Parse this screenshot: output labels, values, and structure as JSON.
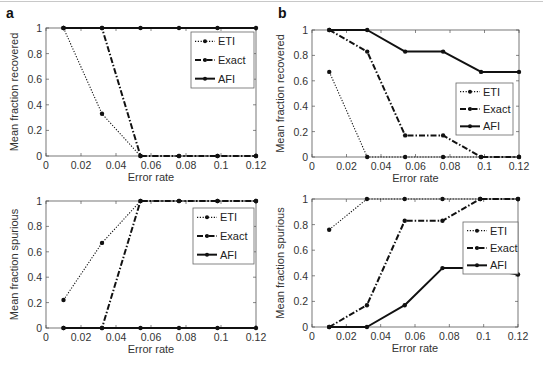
{
  "figure": {
    "panel_labels": [
      "a",
      "b"
    ],
    "series_names": [
      "ETI",
      "Exact",
      "AFI"
    ],
    "xlabel": "Error rate",
    "x_ticks": [
      "0",
      "0.02",
      "0.04",
      "0.06",
      "0.08",
      "0.1",
      "0.12"
    ],
    "y_ticks": [
      "0",
      "0.2",
      "0.4",
      "0.6",
      "0.8",
      "1"
    ]
  },
  "chart_data": [
    {
      "id": "a-recovered",
      "panel": "a",
      "type": "line",
      "title": "",
      "xlabel": "Error rate",
      "ylabel": "Mean fraction recovered",
      "xlim": [
        0,
        0.12
      ],
      "ylim": [
        0,
        1
      ],
      "grid": false,
      "legend_position": "upper right",
      "x": [
        0.01,
        0.032,
        0.054,
        0.076,
        0.098,
        0.12
      ],
      "series": [
        {
          "name": "ETI",
          "style": "dotted",
          "values": [
            1,
            0.33,
            0,
            0,
            0,
            0
          ]
        },
        {
          "name": "Exact",
          "style": "dashdot",
          "values": [
            1,
            1,
            0,
            0,
            0,
            0
          ]
        },
        {
          "name": "AFI",
          "style": "solid",
          "values": [
            1,
            1,
            1,
            1,
            1,
            1
          ]
        }
      ]
    },
    {
      "id": "b-recovered",
      "panel": "b",
      "type": "line",
      "title": "",
      "xlabel": "Error rate",
      "ylabel": "Mean fraction recovered",
      "xlim": [
        0,
        0.12
      ],
      "ylim": [
        0,
        1
      ],
      "grid": false,
      "legend_position": "center right",
      "x": [
        0.01,
        0.032,
        0.054,
        0.076,
        0.098,
        0.12
      ],
      "series": [
        {
          "name": "ETI",
          "style": "dotted",
          "values": [
            0.67,
            0,
            0,
            0,
            0,
            0
          ]
        },
        {
          "name": "Exact",
          "style": "dashdot",
          "values": [
            1,
            0.83,
            0.17,
            0.17,
            0,
            0
          ]
        },
        {
          "name": "AFI",
          "style": "solid",
          "values": [
            1,
            1,
            0.83,
            0.83,
            0.67,
            0.67
          ]
        }
      ]
    },
    {
      "id": "a-spurious",
      "panel": "a",
      "type": "line",
      "title": "",
      "xlabel": "Error rate",
      "ylabel": "Mean fraction spurious",
      "xlim": [
        0,
        0.12
      ],
      "ylim": [
        0,
        1
      ],
      "grid": false,
      "legend_position": "upper right",
      "x": [
        0.01,
        0.032,
        0.054,
        0.076,
        0.098,
        0.12
      ],
      "series": [
        {
          "name": "ETI",
          "style": "dotted",
          "values": [
            0.22,
            0.67,
            1,
            1,
            1,
            1
          ]
        },
        {
          "name": "Exact",
          "style": "dashdot",
          "values": [
            0,
            0,
            1,
            1,
            1,
            1
          ]
        },
        {
          "name": "AFI",
          "style": "solid",
          "values": [
            0,
            0,
            0,
            0,
            0,
            0
          ]
        }
      ]
    },
    {
      "id": "b-spurious",
      "panel": "b",
      "type": "line",
      "title": "",
      "xlabel": "Error rate",
      "ylabel": "Mean fraction spurious",
      "xlim": [
        0,
        0.12
      ],
      "ylim": [
        0,
        1
      ],
      "grid": false,
      "legend_position": "upper right",
      "x": [
        0.01,
        0.032,
        0.054,
        0.076,
        0.098,
        0.12
      ],
      "series": [
        {
          "name": "ETI",
          "style": "dotted",
          "values": [
            0.76,
            1,
            1,
            1,
            1,
            1
          ]
        },
        {
          "name": "Exact",
          "style": "dashdot",
          "values": [
            0,
            0.17,
            0.83,
            0.83,
            1,
            1
          ]
        },
        {
          "name": "AFI",
          "style": "solid",
          "values": [
            0,
            0,
            0.17,
            0.46,
            0.46,
            0.41
          ]
        }
      ]
    }
  ],
  "layout": {
    "axes": [
      {
        "x0": 46,
        "x1": 256,
        "yTop": 28,
        "yBot": 156,
        "legend": {
          "x": 191,
          "y": 32,
          "w": 63,
          "h": 56
        },
        "panel_label": {
          "x": 6,
          "y": 18
        }
      },
      {
        "x0": 312,
        "x1": 519,
        "yTop": 30,
        "yBot": 157,
        "legend": {
          "x": 456,
          "y": 83,
          "w": 57,
          "h": 52
        },
        "panel_label": {
          "x": 278,
          "y": 18
        }
      },
      {
        "x0": 46,
        "x1": 256,
        "yTop": 201,
        "yBot": 328,
        "legend": {
          "x": 193,
          "y": 208,
          "w": 61,
          "h": 56
        },
        "panel_label": null
      },
      {
        "x0": 312,
        "x1": 518,
        "yTop": 199,
        "yBot": 327,
        "legend": {
          "x": 463,
          "y": 222,
          "w": 55,
          "h": 52
        },
        "panel_label": null
      }
    ],
    "colors": {
      "axis": "#555555",
      "line": "#111111",
      "legend_border": "#666666"
    }
  }
}
